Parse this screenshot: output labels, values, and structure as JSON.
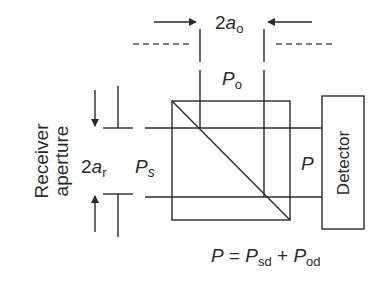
{
  "diagram": {
    "type": "beam-splitter receiver schematic",
    "labels": {
      "local_aperture_prefix": "2",
      "local_aperture_var": "a",
      "local_aperture_sub": "o",
      "local_power_var": "P",
      "local_power_sub": "o",
      "receiver_aperture_prefix": "2",
      "receiver_aperture_var": "a",
      "receiver_aperture_sub": "r",
      "signal_power_var": "P",
      "signal_power_sub": "s",
      "combined_power": "P",
      "receiver_line1": "Receiver",
      "receiver_line2": "aperture",
      "detector": "Detector"
    },
    "equation": {
      "lhs": "P",
      "eq": " = ",
      "term1_var": "P",
      "term1_sub": "sd",
      "plus": " + ",
      "term2_var": "P",
      "term2_sub": "od"
    },
    "colors": {
      "line": "#2a2a2a",
      "background": "#ffffff"
    }
  }
}
